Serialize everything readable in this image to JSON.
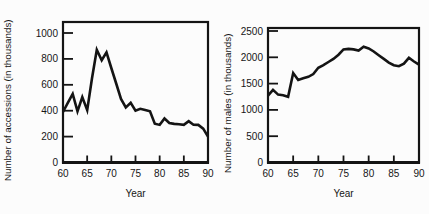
{
  "figure": {
    "background": "#fcfcfc",
    "ink_color": "#141414"
  },
  "chart_data": [
    {
      "type": "line",
      "name": "accessions",
      "xlabel": "Year",
      "ylabel": "Number of accessions (in thousands)",
      "xlim": [
        60,
        90
      ],
      "ylim": [
        0,
        1000
      ],
      "xticks": [
        60,
        65,
        70,
        75,
        80,
        85,
        90
      ],
      "yticks": [
        0,
        200,
        400,
        600,
        800,
        1000
      ],
      "grid": false,
      "frame": "box",
      "line_color": "#141414",
      "x": [
        60,
        61,
        62,
        63,
        64,
        65,
        66,
        67,
        68,
        69,
        70,
        71,
        72,
        73,
        74,
        75,
        76,
        77,
        78,
        79,
        80,
        81,
        82,
        83,
        84,
        85,
        86,
        87,
        88,
        89,
        90
      ],
      "y": [
        390,
        460,
        530,
        395,
        505,
        405,
        650,
        870,
        790,
        850,
        730,
        610,
        490,
        425,
        460,
        400,
        415,
        405,
        395,
        300,
        290,
        340,
        305,
        298,
        295,
        290,
        320,
        292,
        290,
        262,
        200
      ]
    },
    {
      "type": "line",
      "name": "males",
      "xlabel": "Year",
      "ylabel": "Number of males (in thousands)",
      "xlim": [
        60,
        90
      ],
      "ylim": [
        0,
        2500
      ],
      "xticks": [
        60,
        65,
        70,
        75,
        80,
        85,
        90
      ],
      "yticks": [
        0,
        500,
        1000,
        1500,
        2000,
        2500
      ],
      "grid": false,
      "frame": "box",
      "line_color": "#141414",
      "x": [
        60,
        61,
        62,
        63,
        64,
        65,
        66,
        67,
        68,
        69,
        70,
        71,
        72,
        73,
        74,
        75,
        76,
        77,
        78,
        79,
        80,
        81,
        82,
        83,
        84,
        85,
        86,
        87,
        88,
        89,
        90
      ],
      "y": [
        1270,
        1380,
        1290,
        1280,
        1250,
        1700,
        1570,
        1600,
        1630,
        1680,
        1800,
        1850,
        1910,
        1970,
        2050,
        2150,
        2160,
        2150,
        2130,
        2200,
        2170,
        2110,
        2040,
        1970,
        1900,
        1850,
        1830,
        1880,
        1990,
        1920,
        1860
      ]
    }
  ]
}
